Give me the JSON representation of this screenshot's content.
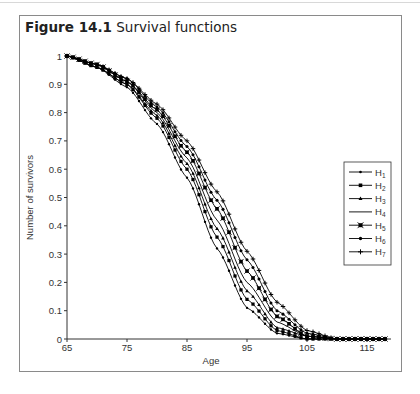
{
  "figure": {
    "label": "Figure 14.1",
    "caption": "Survival functions"
  },
  "chart_data": {
    "type": "line",
    "title": "Survival functions",
    "xlabel": "Age",
    "ylabel": "Number of survivors",
    "xlim": [
      65,
      119
    ],
    "ylim": [
      0,
      1
    ],
    "xticks": [
      65,
      75,
      85,
      95,
      105,
      115
    ],
    "yticks": [
      0,
      0.1,
      0.2,
      0.3,
      0.4,
      0.5,
      0.6,
      0.7,
      0.8,
      0.9,
      1
    ],
    "grid": false,
    "legend_position": "right",
    "x": [
      65,
      70,
      75,
      80,
      85,
      90,
      95,
      100,
      105,
      110,
      115,
      118
    ],
    "series": [
      {
        "name": "H1",
        "marker": "small-dot",
        "values": [
          1.0,
          0.96,
          0.89,
          0.76,
          0.57,
          0.32,
          0.11,
          0.02,
          0.0,
          0.0,
          0.0,
          0.0
        ]
      },
      {
        "name": "H2",
        "marker": "square",
        "values": [
          1.0,
          0.96,
          0.9,
          0.78,
          0.6,
          0.36,
          0.14,
          0.03,
          0.0,
          0.0,
          0.0,
          0.0
        ]
      },
      {
        "name": "H3",
        "marker": "triangle",
        "values": [
          1.0,
          0.96,
          0.9,
          0.79,
          0.62,
          0.39,
          0.17,
          0.04,
          0.01,
          0.0,
          0.0,
          0.0
        ]
      },
      {
        "name": "H4",
        "marker": "none",
        "values": [
          1.0,
          0.97,
          0.91,
          0.8,
          0.64,
          0.42,
          0.2,
          0.06,
          0.01,
          0.0,
          0.0,
          0.0
        ]
      },
      {
        "name": "H5",
        "marker": "x-square",
        "values": [
          1.0,
          0.97,
          0.91,
          0.81,
          0.66,
          0.46,
          0.24,
          0.08,
          0.01,
          0.0,
          0.0,
          0.0
        ]
      },
      {
        "name": "H6",
        "marker": "dot",
        "values": [
          1.0,
          0.97,
          0.92,
          0.82,
          0.68,
          0.49,
          0.28,
          0.1,
          0.02,
          0.0,
          0.0,
          0.0
        ]
      },
      {
        "name": "H7",
        "marker": "plus",
        "values": [
          1.0,
          0.97,
          0.92,
          0.83,
          0.7,
          0.52,
          0.31,
          0.13,
          0.03,
          0.0,
          0.0,
          0.0
        ]
      }
    ]
  },
  "legend": {
    "items": [
      {
        "label": "H",
        "sub": "1"
      },
      {
        "label": "H",
        "sub": "2"
      },
      {
        "label": "H",
        "sub": "3"
      },
      {
        "label": "H",
        "sub": "4"
      },
      {
        "label": "H",
        "sub": "5"
      },
      {
        "label": "H",
        "sub": "6"
      },
      {
        "label": "H",
        "sub": "7"
      }
    ]
  }
}
